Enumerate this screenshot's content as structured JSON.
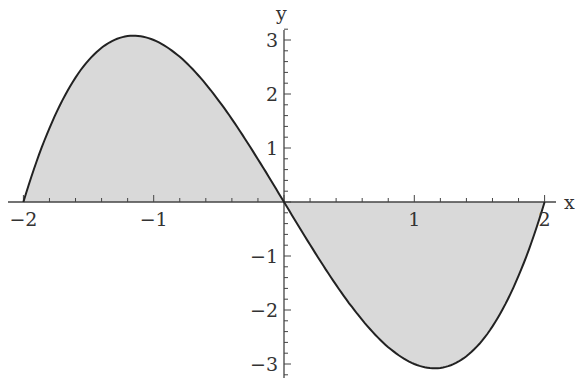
{
  "chart_data": {
    "type": "area",
    "title": "",
    "function": "x^3 - 4x",
    "xlabel": "x",
    "ylabel": "y",
    "xlim": [
      -2,
      2
    ],
    "ylim": [
      -3.1,
      3.1
    ],
    "grid": false,
    "legend": null,
    "x_ticks": [
      -2,
      -1,
      1,
      2
    ],
    "x_tick_labels": [
      "−2",
      "−1",
      "1",
      "2"
    ],
    "y_ticks": [
      -3,
      -2,
      -1,
      1,
      2,
      3
    ],
    "y_tick_labels": [
      "−3",
      "−2",
      "−1",
      "1",
      "2",
      "3"
    ],
    "x": [
      -2,
      -1.5,
      -1.155,
      -1,
      -0.5,
      0,
      0.5,
      1,
      1.155,
      1.5,
      2
    ],
    "series": [
      {
        "name": "f(x)",
        "values": [
          0,
          2.625,
          3.079,
          3,
          1.875,
          0,
          -1.875,
          -3,
          -3.079,
          -2.625,
          0
        ]
      }
    ],
    "fill": "shaded region between curve and x-axis",
    "colors": {
      "curve": "#222222",
      "fill": "#d9d9d9",
      "axis": "#444444"
    }
  }
}
